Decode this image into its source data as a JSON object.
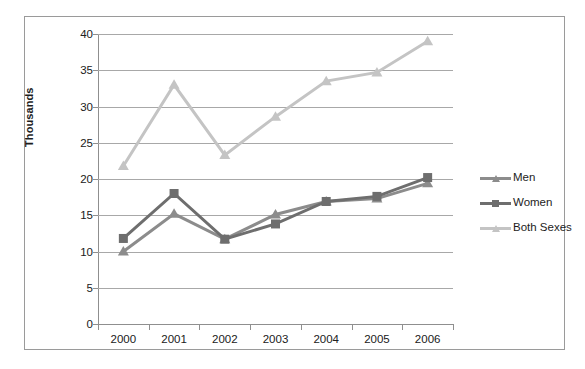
{
  "scan_title": "",
  "axis": {
    "ylabel": "Thousands",
    "yticks": [
      "0",
      "5",
      "10",
      "15",
      "20",
      "25",
      "30",
      "35",
      "40"
    ],
    "xticks": [
      "2000",
      "2001",
      "2002",
      "2003",
      "2004",
      "2005",
      "2006"
    ]
  },
  "legend": {
    "items": [
      {
        "label": "Men",
        "color": "#8c8c8c",
        "marker": "triangle"
      },
      {
        "label": "Women",
        "color": "#6e6e6e",
        "marker": "square"
      },
      {
        "label": "Both Sexes",
        "color": "#c4c4c4",
        "marker": "triangle"
      }
    ]
  },
  "chart_data": {
    "type": "line",
    "title": "",
    "xlabel": "",
    "ylabel": "Thousands",
    "categories": [
      "2000",
      "2001",
      "2002",
      "2003",
      "2004",
      "2005",
      "2006"
    ],
    "series": [
      {
        "name": "Men",
        "color": "#8c8c8c",
        "marker": "triangle",
        "values": [
          10.0,
          15.2,
          11.7,
          15.1,
          16.9,
          17.3,
          19.4
        ]
      },
      {
        "name": "Women",
        "color": "#6e6e6e",
        "marker": "square",
        "values": [
          11.8,
          18.0,
          11.7,
          13.8,
          16.9,
          17.6,
          20.2
        ]
      },
      {
        "name": "Both Sexes",
        "color": "#c4c4c4",
        "marker": "triangle",
        "values": [
          21.8,
          33.0,
          23.3,
          28.6,
          33.5,
          34.7,
          39.0
        ]
      }
    ],
    "ylim": [
      0,
      40
    ],
    "ytick_step": 5,
    "grid": "horizontal",
    "legend_position": "right"
  }
}
